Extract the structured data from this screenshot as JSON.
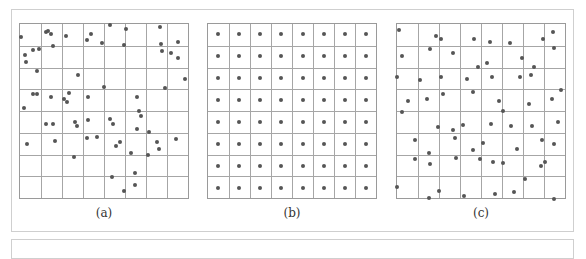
{
  "figure": {
    "grid": {
      "rows": 8,
      "cols": 8
    },
    "colors": {
      "grid_line": "#a6a6a6",
      "dot": "#555555",
      "frame": "#cfcfcf"
    },
    "panels": [
      {
        "id": "a",
        "label": "(a)",
        "pattern": "clustered random",
        "dots": [
          [
            1,
            8
          ],
          [
            15.6,
            5.1
          ],
          [
            17,
            4.3
          ],
          [
            18.9,
            6.2
          ],
          [
            20,
            13.1
          ],
          [
            27.8,
            7.4
          ],
          [
            40,
            9.7
          ],
          [
            42.2,
            6.2
          ],
          [
            48.9,
            11.4
          ],
          [
            53.5,
            1.1
          ],
          [
            62.9,
            3.4
          ],
          [
            61.8,
            12.5
          ],
          [
            82.9,
            2.3
          ],
          [
            83.5,
            11.9
          ],
          [
            93.5,
            10.8
          ],
          [
            8.2,
            15.3
          ],
          [
            11.8,
            14.8
          ],
          [
            3.5,
            18.2
          ],
          [
            4.1,
            22.2
          ],
          [
            84.1,
            15.9
          ],
          [
            89.4,
            17
          ],
          [
            93.5,
            19.9
          ],
          [
            10.6,
            27.3
          ],
          [
            34.7,
            29.5
          ],
          [
            97.6,
            31.8
          ],
          [
            85.9,
            36.9
          ],
          [
            50,
            36.4
          ],
          [
            8.2,
            40.3
          ],
          [
            10.6,
            40.3
          ],
          [
            18.9,
            42
          ],
          [
            29.4,
            39.8
          ],
          [
            26.5,
            43.2
          ],
          [
            28.2,
            44.9
          ],
          [
            40.6,
            42
          ],
          [
            69.4,
            42
          ],
          [
            2.9,
            48.3
          ],
          [
            70.6,
            50
          ],
          [
            71.8,
            52.8
          ],
          [
            53.5,
            54.5
          ],
          [
            55.3,
            57.4
          ],
          [
            15.9,
            57.4
          ],
          [
            20,
            57.4
          ],
          [
            32.9,
            56.3
          ],
          [
            34.1,
            58.5
          ],
          [
            40.6,
            55.1
          ],
          [
            69.4,
            60.2
          ],
          [
            76.5,
            61.9
          ],
          [
            92.4,
            65.9
          ],
          [
            81.2,
            67.6
          ],
          [
            82.4,
            71.6
          ],
          [
            4.7,
            68.8
          ],
          [
            21.2,
            67
          ],
          [
            40,
            65.3
          ],
          [
            45.9,
            64.8
          ],
          [
            57.1,
            69.9
          ],
          [
            59.4,
            67.6
          ],
          [
            65.9,
            73.9
          ],
          [
            75.9,
            75
          ],
          [
            32.4,
            76.1
          ],
          [
            68.2,
            85.2
          ],
          [
            54.7,
            87.5
          ],
          [
            68.2,
            92
          ],
          [
            61.8,
            95.5
          ]
        ]
      },
      {
        "id": "b",
        "label": "(b)",
        "pattern": "uniform centered",
        "dots": "cell-centers"
      },
      {
        "id": "c",
        "label": "(c)",
        "pattern": "jittered random",
        "dots": [
          [
            1.8,
            4
          ],
          [
            23.4,
            7.4
          ],
          [
            26.3,
            9.1
          ],
          [
            45.6,
            9.1
          ],
          [
            55,
            10.8
          ],
          [
            67.3,
            11.4
          ],
          [
            86.5,
            9.1
          ],
          [
            92.4,
            5.1
          ],
          [
            93,
            14.2
          ],
          [
            3.5,
            18.8
          ],
          [
            19.9,
            14.8
          ],
          [
            33.3,
            17
          ],
          [
            74.3,
            19.9
          ],
          [
            53.8,
            22.7
          ],
          [
            48.5,
            25
          ],
          [
            81.3,
            25
          ],
          [
            0.6,
            30.7
          ],
          [
            14,
            32.4
          ],
          [
            26.3,
            30.7
          ],
          [
            41.5,
            31.8
          ],
          [
            56.7,
            30.7
          ],
          [
            73.1,
            30.7
          ],
          [
            79.5,
            29.5
          ],
          [
            97.1,
            38.1
          ],
          [
            7,
            44.3
          ],
          [
            18.1,
            43.2
          ],
          [
            27.5,
            40.3
          ],
          [
            45,
            39.2
          ],
          [
            60.8,
            44.3
          ],
          [
            78.4,
            46
          ],
          [
            91.8,
            43.2
          ],
          [
            3.5,
            50.6
          ],
          [
            63.2,
            50
          ],
          [
            24.6,
            59.1
          ],
          [
            33.3,
            60.8
          ],
          [
            39.2,
            58
          ],
          [
            56.1,
            57.4
          ],
          [
            67.8,
            58.5
          ],
          [
            80.1,
            58.5
          ],
          [
            95.3,
            56.3
          ],
          [
            11.1,
            66.5
          ],
          [
            34.5,
            65.3
          ],
          [
            50.9,
            68.2
          ],
          [
            86,
            66.5
          ],
          [
            93,
            68.8
          ],
          [
            19.3,
            73.9
          ],
          [
            45,
            72.2
          ],
          [
            71.3,
            71.6
          ],
          [
            11.1,
            77.3
          ],
          [
            19.9,
            80.1
          ],
          [
            35.1,
            76.7
          ],
          [
            49.7,
            77.3
          ],
          [
            57.3,
            79
          ],
          [
            63.2,
            79.5
          ],
          [
            85.4,
            81.2
          ],
          [
            87.7,
            79
          ],
          [
            76,
            88.6
          ],
          [
            0.6,
            93.2
          ],
          [
            25.1,
            95.5
          ],
          [
            58.5,
            97.2
          ],
          [
            69.6,
            96
          ],
          [
            19.3,
            99.4
          ],
          [
            39.8,
            98.3
          ],
          [
            93,
            100
          ]
        ]
      }
    ]
  }
}
